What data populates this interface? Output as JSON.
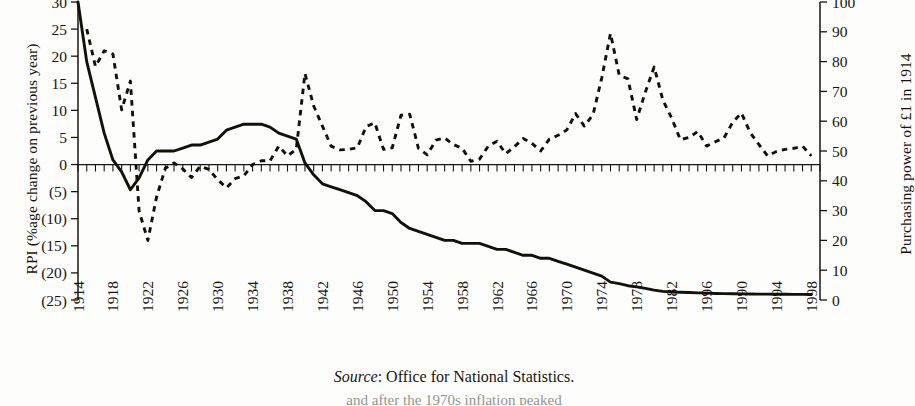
{
  "figure": {
    "source_label": "Source",
    "source_text": ": Office for National Statistics.",
    "clipped_caption": "and after the 1970s inflation peaked"
  },
  "axes": {
    "left": {
      "title": "RPI (%age change on previous year)",
      "tick_labels": [
        "30",
        "25",
        "20",
        "15",
        "10",
        "5",
        "0",
        "(5)",
        "(10)",
        "(15)",
        "(20)",
        "(25)"
      ],
      "tick_values": [
        30,
        25,
        20,
        15,
        10,
        5,
        0,
        -5,
        -10,
        -15,
        -20,
        -25
      ],
      "min": -25,
      "max": 30
    },
    "right": {
      "title": "Purchasing power of £1 in 1914",
      "tick_labels": [
        "100",
        "90",
        "80",
        "70",
        "60",
        "50",
        "40",
        "30",
        "20",
        "10",
        "0"
      ],
      "tick_values": [
        100,
        90,
        80,
        70,
        60,
        50,
        40,
        30,
        20,
        10,
        0
      ],
      "min": 0,
      "max": 100
    },
    "bottom": {
      "tick_labels": [
        "1914",
        "1918",
        "1922",
        "1926",
        "1930",
        "1934",
        "1938",
        "1942",
        "1946",
        "1950",
        "1954",
        "1958",
        "1962",
        "1966",
        "1970",
        "1974",
        "1978",
        "1982",
        "1996",
        "1990",
        "1994",
        "1998"
      ],
      "tick_step_years": 4,
      "first_year": 1914,
      "last_year": 1998
    }
  },
  "colors": {
    "ink": "#16150f",
    "paper": "#fdfdfb",
    "solid_series": "#111009",
    "dashed_series": "#111009"
  },
  "chart_data": {
    "type": "line",
    "title": "",
    "xlabel": "",
    "ylabel": "RPI (%age change on previous year)",
    "y2label": "Purchasing power of £1 in 1914",
    "xlim": [
      1914,
      1999
    ],
    "ylim": [
      -25,
      30
    ],
    "y2lim": [
      0,
      100
    ],
    "grid": false,
    "legend": "none",
    "x": [
      1914,
      1915,
      1916,
      1917,
      1918,
      1919,
      1920,
      1921,
      1922,
      1923,
      1924,
      1925,
      1926,
      1927,
      1928,
      1929,
      1930,
      1931,
      1932,
      1933,
      1934,
      1935,
      1936,
      1937,
      1938,
      1939,
      1940,
      1941,
      1942,
      1943,
      1944,
      1945,
      1946,
      1947,
      1948,
      1949,
      1950,
      1951,
      1952,
      1953,
      1954,
      1955,
      1956,
      1957,
      1958,
      1959,
      1960,
      1961,
      1962,
      1963,
      1964,
      1965,
      1966,
      1967,
      1968,
      1969,
      1970,
      1971,
      1972,
      1973,
      1974,
      1975,
      1976,
      1977,
      1978,
      1979,
      1980,
      1981,
      1982,
      1983,
      1984,
      1985,
      1986,
      1987,
      1988,
      1989,
      1990,
      1991,
      1992,
      1993,
      1994,
      1995,
      1996,
      1997,
      1998
    ],
    "series": [
      {
        "name": "RPI (%age change on previous year)",
        "axis": "left",
        "style": "dashed",
        "values": [
          null,
          25.0,
          18.1,
          21.0,
          20.4,
          10.1,
          15.4,
          -8.6,
          -14.0,
          -6.0,
          -0.7,
          0.3,
          -0.8,
          -2.4,
          -0.3,
          -0.9,
          -2.8,
          -4.3,
          -2.6,
          -2.1,
          0.0,
          0.7,
          0.7,
          3.4,
          1.6,
          2.8,
          16.8,
          10.8,
          7.1,
          3.4,
          2.7,
          2.8,
          3.1,
          7.0,
          7.7,
          2.8,
          3.1,
          9.1,
          9.3,
          3.0,
          1.8,
          4.5,
          4.9,
          3.7,
          3.0,
          0.6,
          1.0,
          3.4,
          4.3,
          2.0,
          3.3,
          4.8,
          3.9,
          2.5,
          4.7,
          5.4,
          6.4,
          9.4,
          7.1,
          9.2,
          16.0,
          24.2,
          16.5,
          15.8,
          8.3,
          13.4,
          18.0,
          11.9,
          8.6,
          4.6,
          5.0,
          6.1,
          3.4,
          4.2,
          4.9,
          7.8,
          9.5,
          5.9,
          3.7,
          1.6,
          2.4,
          2.8,
          3.0,
          3.4,
          1.6
        ]
      },
      {
        "name": "Purchasing power of £1 in 1914",
        "axis": "right",
        "style": "solid",
        "values": [
          100,
          80,
          68,
          56,
          47,
          43,
          37,
          41,
          47,
          50,
          50,
          50,
          51,
          52,
          52,
          53,
          54,
          57,
          58,
          59,
          59,
          59,
          58,
          56,
          55,
          54,
          46,
          42,
          39,
          38,
          37,
          36,
          35,
          33,
          30,
          30,
          29,
          26,
          24,
          23,
          22,
          21,
          20,
          20,
          19,
          19,
          19,
          18,
          17,
          17,
          16,
          15,
          15,
          14,
          14,
          13,
          12,
          11,
          10,
          9,
          8,
          6,
          5.5,
          4.8,
          4.4,
          3.9,
          3.3,
          2.9,
          2.7,
          2.6,
          2.5,
          2.4,
          2.3,
          2.2,
          2.15,
          2.1,
          2.05,
          2.0,
          1.98,
          1.96,
          1.94,
          1.92,
          1.9,
          1.88,
          1.86
        ]
      }
    ]
  }
}
